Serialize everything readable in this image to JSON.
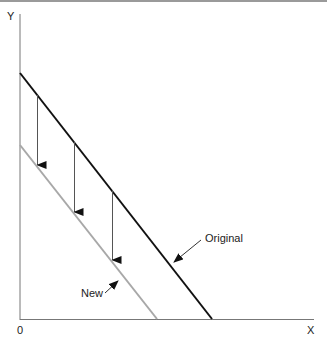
{
  "diagram": {
    "axes": {
      "y_label": "Y",
      "x_label": "X",
      "origin_label": "0"
    },
    "lines": [
      {
        "name": "Original",
        "label": "Original",
        "color": "#111111",
        "y_intercept_px": 73,
        "x_intercept_px": 212
      },
      {
        "name": "New",
        "label": "New",
        "color": "#a8a8a8",
        "y_intercept_px": 145,
        "x_intercept_px": 157
      }
    ],
    "shift_arrows": [
      {
        "x": 37
      },
      {
        "x": 74
      },
      {
        "x": 112
      }
    ]
  }
}
